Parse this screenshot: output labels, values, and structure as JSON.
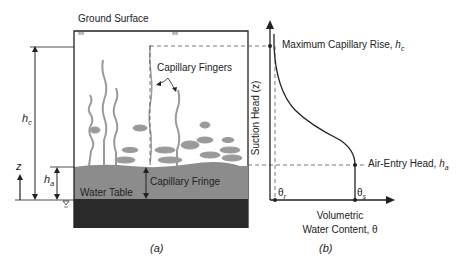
{
  "panel_a": {
    "ground_surface": "Ground Surface",
    "capillary_fingers": "Capillary Fingers",
    "capillary_fringe": "Capillary Fringe",
    "water_table": "Water Table",
    "h_c": "h",
    "h_c_sub": "c",
    "h_a": "h",
    "h_a_sub": "a",
    "z": "z",
    "caption": "(a)"
  },
  "panel_b": {
    "max_capillary_rise": "Maximum Capillary Rise, ",
    "max_capillary_rise_sym": "h",
    "max_capillary_rise_sub": "c",
    "air_entry_head": "Air-Entry Head, ",
    "air_entry_head_sym": "h",
    "air_entry_head_sub": "a",
    "y_axis_label": "Suction Head (z)",
    "x_axis_label_line1": "Volumetric",
    "x_axis_label_line2": "Water Content, θ",
    "theta_r": "θ",
    "theta_r_sub": "r",
    "theta_s": "θ",
    "theta_s_sub": "s",
    "caption": "(b)"
  },
  "colors": {
    "fringe": "#8c8c8c",
    "saturated": "#2a2a2a",
    "fingers": "#9a9a9a",
    "line": "#222222"
  }
}
